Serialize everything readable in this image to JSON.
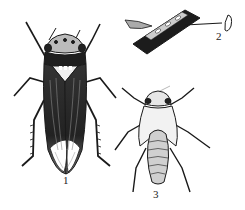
{
  "figure": {
    "colors": {
      "ink": "#1a1a1a",
      "mid": "#555555",
      "light": "#9a9a9a",
      "paper": "#ffffff"
    },
    "panels": [
      {
        "id": 1,
        "label": "1",
        "subject": "adult"
      },
      {
        "id": 2,
        "label": "2",
        "subject": "eggs in plant tissue"
      },
      {
        "id": 3,
        "label": "3",
        "subject": "nymph"
      }
    ]
  }
}
